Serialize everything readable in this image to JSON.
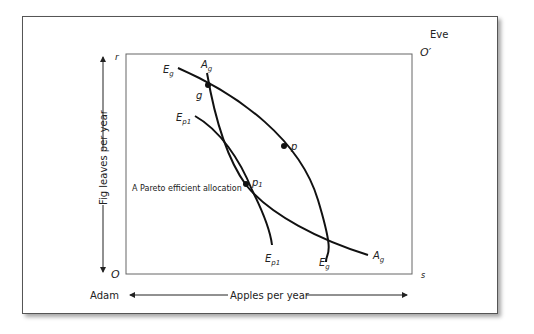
{
  "diagram": {
    "type": "edgeworth-box",
    "owners": {
      "bottom_left": "Adam",
      "top_right": "Eve"
    },
    "origins": {
      "adam": "O",
      "eve": "O′"
    },
    "corners": {
      "top_left": "r",
      "bottom_right": "s"
    },
    "axes": {
      "x_label": "Apples per year",
      "y_label": "Fig leaves per year"
    },
    "curves": [
      {
        "id": "Eg",
        "label_start": "E",
        "label_start_sub": "g",
        "label_end": "E",
        "label_end_sub": "g"
      },
      {
        "id": "Ag",
        "label_start": "A",
        "label_start_sub": "g",
        "label_end": "A",
        "label_end_sub": "g"
      },
      {
        "id": "Ep1",
        "label_start": "E",
        "label_start_sub": "p1",
        "label_end": "E",
        "label_end_sub": "p1"
      }
    ],
    "points": [
      {
        "id": "g",
        "label": "g"
      },
      {
        "id": "p",
        "label": "p"
      },
      {
        "id": "p1",
        "label": "p",
        "label_sub": "1"
      }
    ],
    "annotation": "A Pareto efficient allocation",
    "colors": {
      "line": "#111111",
      "box": "#555555",
      "text": "#222222"
    }
  }
}
